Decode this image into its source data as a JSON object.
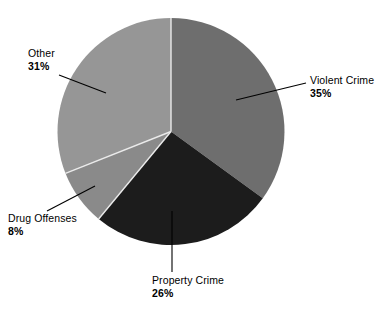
{
  "chart_data": {
    "type": "pie",
    "title": "",
    "subtitle": "",
    "xlabel": "",
    "ylabel": "",
    "legend_position": "none",
    "grid": false,
    "labels_on_slices": false,
    "start_angle_deg": 0,
    "direction": "clockwise",
    "categories": [
      "Violent Crime",
      "Property Crime",
      "Drug Offenses",
      "Other"
    ],
    "values": [
      35,
      26,
      8,
      31
    ],
    "value_suffix": "%",
    "slices": [
      {
        "name": "Violent Crime",
        "value": 35,
        "label": "Violent Crime",
        "percent_text": "35%",
        "color": "#6e6e6e",
        "start_deg": 0,
        "end_deg": 126
      },
      {
        "name": "Property Crime",
        "value": 26,
        "label": "Property Crime",
        "percent_text": "26%",
        "color": "#1c1c1c",
        "start_deg": 126,
        "end_deg": 219.6
      },
      {
        "name": "Drug Offenses",
        "value": 8,
        "label": "Drug Offenses",
        "percent_text": "8%",
        "color": "#8a8a8a",
        "start_deg": 219.6,
        "end_deg": 248.4
      },
      {
        "name": "Other",
        "value": 31,
        "label": "Other",
        "percent_text": "31%",
        "color": "#969696",
        "start_deg": 248.4,
        "end_deg": 360
      }
    ]
  },
  "colors": {
    "background": "#ffffff",
    "slice_divider": "#e8e8e8",
    "leader_line": "#000000",
    "text": "#000000",
    "violent_crime": "#6e6e6e",
    "property_crime": "#1c1c1c",
    "drug_offenses": "#8a8a8a",
    "other": "#969696"
  }
}
